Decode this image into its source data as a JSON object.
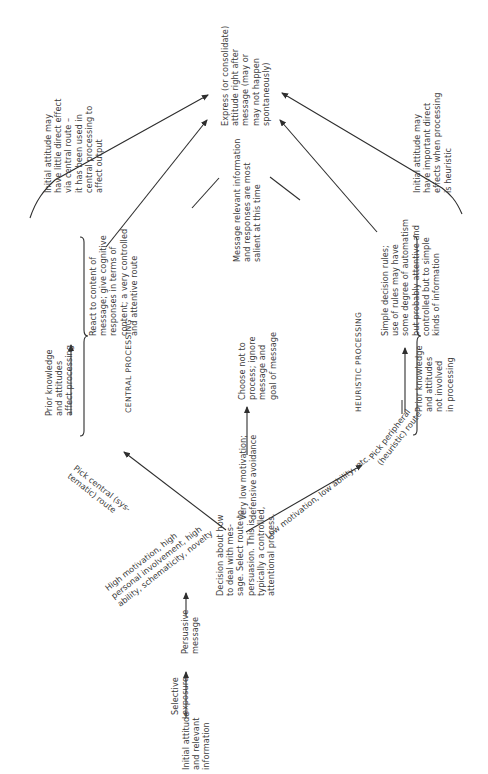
{
  "diagram": {
    "orientation": "rotated 90 degrees counter-clockwise",
    "nodes": {
      "initial": "Initial attitude\nand relevant\ninformation",
      "selective_exposure": "Selective\nexposure",
      "persuasive_message": "Persuasive\nmessage",
      "decision": "Decision about how\nto deal with mes-\nsage. Select route to\npersuasion. This is\ntypically a controlled,\nattentional process.",
      "very_low_motivation": "Very low motivation;\ndefensive avoidance",
      "choose_not_to_process": "Choose not to\nprocess; ignore\nmessage and\ngoal of message",
      "central_condition": "High motivation, high\npersonal involvement, high\nability, schematicity, novelty",
      "central_route": "Pick central (sys-\ntematic) route",
      "central_heading": "CENTRAL PROCESSING",
      "central_prior": "Prior knowledge\nand attitudes\naffect processing",
      "central_react": "React to content of\nmessage; give cognitive\nresponses in terms of\ncontent; a very controlled\nand attentive route",
      "peripheral_condition": "Low motivation, low ability, etc.",
      "peripheral_route": "Pick peripheral\n(heuristic) route",
      "heuristic_heading": "HEURISTIC PROCESSING",
      "heuristic_prior": "Prior knowledge\nand attitudes\nnot involved\nin processing",
      "heuristic_rules": "Simple decision rules;\nuse of rules may have\nsome degree of automatism\nbut probably attentive and\ncontrolled but to simple\nkinds of information",
      "salient": "Message relevant information\nand responses are most\nsalient at this time",
      "express": "Express (or consolidate)\nattitude right after\nmessage (may or\nmay not happen\nspontaneously)",
      "central_note": "Initial attitude may\nhave little direct effect\nvia central route –\nit has been used in\ncentral processing to\naffect output",
      "heuristic_note": "Initial attitude may\nhave important direct\neffects when processing\nis heuristic"
    },
    "colors": {
      "line": "#2e2e2e",
      "text": "#3c3c3c",
      "background": "#ffffff"
    }
  }
}
